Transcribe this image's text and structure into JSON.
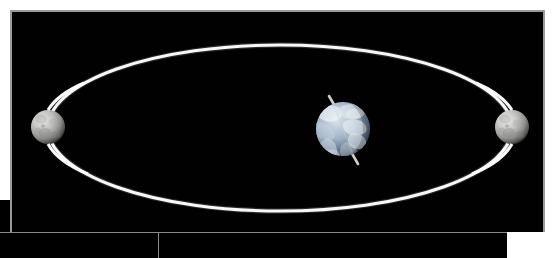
{
  "figure": {
    "title": "Moon orbiting the Earth",
    "caption": "",
    "background_color": "#000000",
    "frame_border_color": "#9a9a9a",
    "page_background": "#ffffff"
  },
  "scene": {
    "orbit": {
      "label": "Moon orbital path",
      "shape": "ellipse",
      "color": "#ffffff",
      "stroke_width_px": 3,
      "center_x": 278,
      "center_y": 126,
      "radius_x": 232,
      "radius_y": 83
    },
    "earth": {
      "label": "Earth",
      "center_x": 341,
      "center_y": 127,
      "radius_px": 27,
      "color": "#c9d6e3",
      "axis": {
        "label": "Earth rotation axis",
        "tilt_degrees": 23,
        "color": "#d8d8d0",
        "length_px": 84
      }
    },
    "moon_left": {
      "label": "Moon (far position)",
      "center_x": 46,
      "center_y": 125,
      "radius_px": 17,
      "color": "#b0b0b0"
    },
    "moon_right": {
      "label": "Moon (near position)",
      "center_x": 510,
      "center_y": 125,
      "radius_px": 17,
      "color": "#b0b0b0"
    }
  },
  "panels": {
    "lower_left_block": "",
    "lower_right_block": ""
  }
}
